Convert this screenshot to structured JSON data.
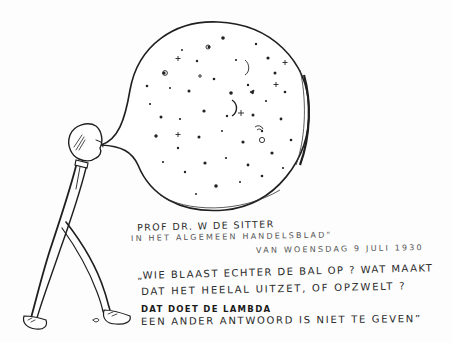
{
  "illustration": {
    "subject": "Man blowing up a balloon filled with stars and planets (the universe)",
    "colors": {
      "ink": "#1f1f1f",
      "paper": "#fdfdfd",
      "faint_ink": "#555555"
    }
  },
  "caption": {
    "attribution": [
      "PROF DR. W DE SITTER",
      "IN HET  ALGEMEEN HANDELSBLAD\"",
      "VAN WOENSDAG 9 JULI 1930"
    ],
    "quote": [
      "„WIE BLAAST ECHTER DE BAL OP ? WAT MAAKT",
      "DAT HET HEELAL UITZET, OF OPZWELT ?",
      "DAT DOET DE LAMBDA",
      "EEN ANDER ANTWOORD IS NIET TE GEVEN”"
    ],
    "pointer_glyph": "➜"
  }
}
